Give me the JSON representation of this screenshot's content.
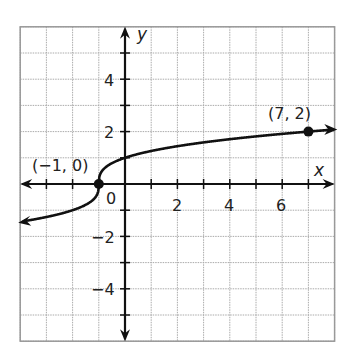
{
  "chart_data": {
    "type": "line",
    "title": "",
    "xlabel": "x",
    "ylabel": "y",
    "xlim": [
      -4,
      8
    ],
    "ylim": [
      -6,
      6
    ],
    "grid": true,
    "x_tick_labels": [
      "2",
      "4",
      "6"
    ],
    "y_tick_labels": [
      "4",
      "2",
      "-2",
      "-4"
    ],
    "origin_label": "0",
    "series": [
      {
        "name": "y = cube root of (x + 1)",
        "x": [
          -4,
          -3,
          -2,
          -1.5,
          -1,
          -0.5,
          0,
          1,
          2,
          3,
          4,
          5,
          6,
          7,
          8
        ],
        "values": [
          -1.44,
          -1.26,
          -1.0,
          -0.79,
          0,
          0.79,
          1.0,
          1.26,
          1.44,
          1.59,
          1.71,
          1.82,
          1.91,
          2.0,
          2.08
        ],
        "arrows": [
          "left",
          "right"
        ]
      }
    ],
    "annotations": [
      {
        "label": "(−1, 0)",
        "x": -1,
        "y": 0,
        "marker": "filled-circle"
      },
      {
        "label": "(7, 2)",
        "x": 7,
        "y": 2,
        "marker": "filled-circle"
      }
    ]
  },
  "labels": {
    "x_axis": "x",
    "y_axis": "y",
    "origin": "0",
    "xt2": "2",
    "xt4": "4",
    "xt6": "6",
    "yt4": "4",
    "yt2": "2",
    "ytm2": "−2",
    "ytm4": "−4",
    "point1": "(−1, 0)",
    "point2": "(7, 2)"
  }
}
